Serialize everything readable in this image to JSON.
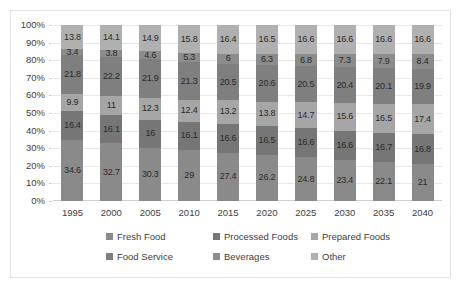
{
  "chart_data": {
    "type": "bar",
    "subtype": "stacked-100-percent",
    "title": "",
    "xlabel": "",
    "ylabel": "",
    "ylim": [
      0,
      100
    ],
    "ytick_labels": [
      "100%",
      "90%",
      "80%",
      "70%",
      "60%",
      "50%",
      "40%",
      "30%",
      "20%",
      "10%",
      "0%"
    ],
    "ytick_values": [
      100,
      90,
      80,
      70,
      60,
      50,
      40,
      30,
      20,
      10,
      0
    ],
    "grid": true,
    "legend_position": "bottom",
    "categories": [
      "1995",
      "2000",
      "2005",
      "2010",
      "2015",
      "2020",
      "2025",
      "2030",
      "2035",
      "2040"
    ],
    "series": [
      {
        "name": "Fresh Food",
        "color": "#8a8a8a",
        "values": [
          34.6,
          32.7,
          30.3,
          29,
          27.4,
          26.2,
          24.8,
          23.4,
          22.1,
          21
        ]
      },
      {
        "name": "Processed Foods",
        "color": "#767676",
        "values": [
          16.4,
          16.1,
          16,
          16.1,
          16.6,
          16.5,
          16.6,
          16.6,
          16.7,
          16.8
        ]
      },
      {
        "name": "Prepared Foods",
        "color": "#a6a6a6",
        "values": [
          9.9,
          11,
          12.3,
          12.4,
          13.2,
          13.8,
          14.7,
          15.6,
          16.5,
          17.4
        ]
      },
      {
        "name": "Food Service",
        "color": "#7f7f7f",
        "values": [
          21.8,
          22.2,
          21.9,
          21.3,
          20.5,
          20.6,
          20.5,
          20.4,
          20.1,
          19.9
        ]
      },
      {
        "name": "Beverages",
        "color": "#8c8c8c",
        "values": [
          3.4,
          3.8,
          4.6,
          5.3,
          6,
          6.3,
          6.8,
          7.3,
          7.9,
          8.4
        ]
      },
      {
        "name": "Other",
        "color": "#b0b0b0",
        "values": [
          13.8,
          14.1,
          14.9,
          15.8,
          16.4,
          16.5,
          16.6,
          16.6,
          16.6,
          16.6
        ]
      }
    ]
  },
  "legend": {
    "items": [
      {
        "label": "Fresh Food",
        "color": "#8a8a8a"
      },
      {
        "label": "Processed Foods",
        "color": "#767676"
      },
      {
        "label": "Prepared Foods",
        "color": "#a6a6a6"
      },
      {
        "label": "Food Service",
        "color": "#7f7f7f"
      },
      {
        "label": "Beverages",
        "color": "#8c8c8c"
      },
      {
        "label": "Other",
        "color": "#b0b0b0"
      }
    ]
  }
}
